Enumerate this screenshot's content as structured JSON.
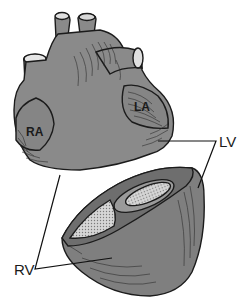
{
  "figure": {
    "colors": {
      "background": "#ffffff",
      "tissue": "#8a8a8a",
      "tissue_dark": "#6e6e6e",
      "cavity": "#c8c8c8",
      "outline": "#1b1b1b"
    },
    "labels": {
      "ra": "RA",
      "la": "LA",
      "lv": "LV",
      "rv": "RV"
    }
  }
}
